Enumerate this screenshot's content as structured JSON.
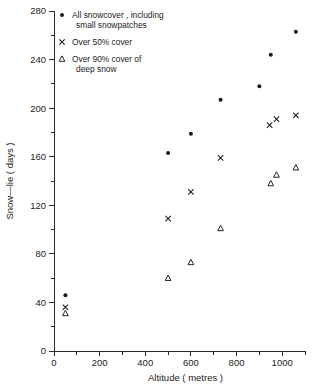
{
  "chart_data": {
    "type": "scatter",
    "title": "",
    "xlabel": "Altitude ( metres )",
    "ylabel": "Snow—lie ( days )",
    "xlim": [
      0,
      1100
    ],
    "ylim": [
      0,
      280
    ],
    "xticks": [
      0,
      200,
      400,
      600,
      800,
      1000
    ],
    "xticklabels": [
      "0",
      "200",
      "400",
      "600",
      "800",
      "1000"
    ],
    "xminor_step": 100,
    "yticks": [
      0,
      40,
      80,
      120,
      160,
      200,
      240,
      280
    ],
    "yticklabels": [
      "0",
      "40",
      "80",
      "120",
      "160",
      "200",
      "240",
      "280"
    ],
    "yminor_step": 20,
    "grid": false,
    "legend_position": "top-left-inside",
    "series": [
      {
        "name": "All snowcover , including small snowpatches",
        "marker": "dot",
        "points": [
          {
            "x": 50,
            "y": 46
          },
          {
            "x": 500,
            "y": 163
          },
          {
            "x": 600,
            "y": 179
          },
          {
            "x": 730,
            "y": 207
          },
          {
            "x": 900,
            "y": 218
          },
          {
            "x": 950,
            "y": 244
          },
          {
            "x": 1060,
            "y": 263
          }
        ]
      },
      {
        "name": "Over 50% cover",
        "marker": "cross",
        "points": [
          {
            "x": 50,
            "y": 36
          },
          {
            "x": 500,
            "y": 109
          },
          {
            "x": 600,
            "y": 131
          },
          {
            "x": 730,
            "y": 159
          },
          {
            "x": 945,
            "y": 186
          },
          {
            "x": 975,
            "y": 191
          },
          {
            "x": 1060,
            "y": 194
          }
        ]
      },
      {
        "name": "Over 90% cover of deep snow",
        "marker": "triangle",
        "points": [
          {
            "x": 50,
            "y": 31
          },
          {
            "x": 500,
            "y": 60
          },
          {
            "x": 600,
            "y": 73
          },
          {
            "x": 730,
            "y": 101
          },
          {
            "x": 950,
            "y": 138
          },
          {
            "x": 975,
            "y": 145
          },
          {
            "x": 1060,
            "y": 151
          }
        ]
      }
    ]
  },
  "legend": {
    "entries": [
      {
        "marker": "dot",
        "line1": "All snowcover , including",
        "line2": "small snowpatches"
      },
      {
        "marker": "cross",
        "line1": "Over 50% cover",
        "line2": ""
      },
      {
        "marker": "triangle",
        "line1": "Over 90% cover of",
        "line2": "deep snow"
      }
    ]
  },
  "colors": {
    "marker": "#1a1a1a",
    "axis": "#2b2b2b",
    "text": "#222222",
    "background": "#ffffff"
  }
}
